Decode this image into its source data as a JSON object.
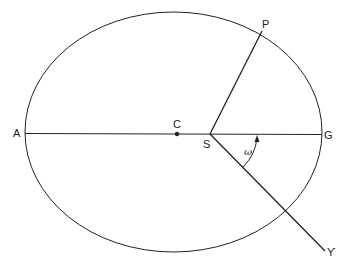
{
  "diagram": {
    "colors": {
      "stroke": "#222222",
      "background": "#ffffff"
    },
    "points": {
      "A": {
        "label": "A",
        "x": 25,
        "y": 133
      },
      "C": {
        "label": "C",
        "x": 177,
        "y": 134
      },
      "S": {
        "label": "S",
        "x": 210,
        "y": 134
      },
      "G": {
        "label": "G",
        "x": 322,
        "y": 134
      },
      "P": {
        "label": "P",
        "x": 262,
        "y": 31
      },
      "T": {
        "label": "ϒ",
        "x": 325,
        "y": 251
      }
    },
    "angle": {
      "label": "ω",
      "from": "S-T",
      "to": "S-G"
    }
  }
}
